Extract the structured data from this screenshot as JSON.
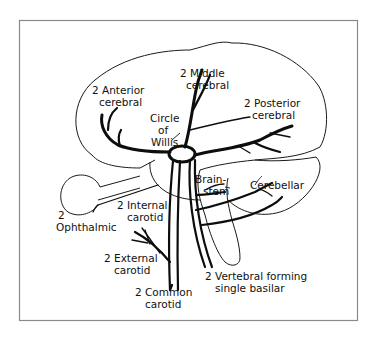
{
  "diagram": {
    "labels": {
      "anterior_cerebral": {
        "line1": "2 Anterior",
        "line2": "cerebral"
      },
      "middle_cerebral": {
        "line1": "2 Middle",
        "line2": "cerebral"
      },
      "posterior_cerebral": {
        "line1": "2 Posterior",
        "line2": "cerebral"
      },
      "circle_of_willis": {
        "line1": "Circle",
        "line2": "of",
        "line3": "Willis"
      },
      "brainstem": {
        "line1": "Brain-",
        "line2": "stem"
      },
      "cerebellar": {
        "line1": "Cerebellar"
      },
      "internal_carotid": {
        "line1": "2 Internal",
        "line2": "carotid"
      },
      "ophthalmic": {
        "line1": "2",
        "line2": "Ophthalmic"
      },
      "external_carotid": {
        "line1": "2 External",
        "line2": "carotid"
      },
      "common_carotid": {
        "line1": "2 Common",
        "line2": "carotid"
      },
      "vertebral": {
        "line1": "2 Vertebral forming",
        "line2": "single basilar"
      }
    },
    "colors": {
      "ink": "#111111",
      "frame": "#8a8a8a",
      "background": "#ffffff"
    }
  }
}
